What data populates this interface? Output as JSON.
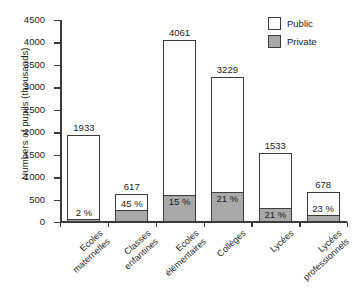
{
  "chart_data": {
    "type": "bar",
    "subtype": "stacked",
    "title": "",
    "xlabel": "",
    "ylabel": "Numbers of pupils (thousands)",
    "ylim": [
      0,
      4500
    ],
    "ytick_labels": [
      "0",
      "500",
      "1000",
      "1500",
      "2000",
      "2500",
      "3000",
      "3500",
      "4000",
      "4500"
    ],
    "ytick_values": [
      0,
      500,
      1000,
      1500,
      2000,
      2500,
      3000,
      3500,
      4000,
      4500
    ],
    "grid": false,
    "legend_position": "top-right",
    "legend": [
      "Public",
      "Private"
    ],
    "categories": [
      "Ecoles maternelles",
      "Classes enfantines",
      "Ecoles élémentaires",
      "Collèges",
      "Lycées",
      "Lycées professionnels"
    ],
    "totals": [
      1933,
      617,
      4061,
      3229,
      1533,
      678
    ],
    "total_labels": [
      "1933",
      "617",
      "4061",
      "3229",
      "1533",
      "678"
    ],
    "private_pct": [
      2,
      45,
      15,
      21,
      21,
      23
    ],
    "private_pct_labels": [
      "2 %",
      "45 %",
      "15 %",
      "21 %",
      "21 %",
      "23 %"
    ],
    "series": [
      {
        "name": "Private",
        "values": [
          39,
          278,
          609,
          678,
          322,
          156
        ]
      },
      {
        "name": "Public",
        "values": [
          1894,
          339,
          3452,
          2551,
          1211,
          522
        ]
      }
    ],
    "colors": {
      "public": "#ffffff",
      "private": "#a9a9a9",
      "outline": "#3b3b3b"
    }
  },
  "legend": {
    "public_label": "Public",
    "private_label": "Private"
  }
}
